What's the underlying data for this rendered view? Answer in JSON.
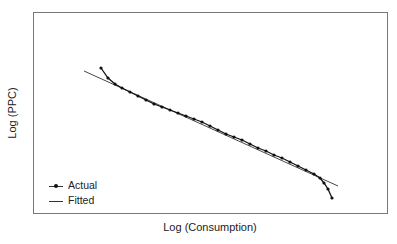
{
  "chart_data": {
    "type": "line",
    "title": "",
    "xlabel": "Log (Consumption)",
    "ylabel": "Log (PPC)",
    "grid": false,
    "ticks": false,
    "legend_position": "lower-left",
    "legend": [
      "Actual",
      "Fitted"
    ],
    "series": [
      {
        "name": "Actual",
        "style": "line-with-dot-markers",
        "points_px": [
          [
            101,
            68
          ],
          [
            108,
            78
          ],
          [
            115,
            84
          ],
          [
            122,
            88
          ],
          [
            130,
            92
          ],
          [
            138,
            96
          ],
          [
            146,
            100
          ],
          [
            154,
            104
          ],
          [
            162,
            107
          ],
          [
            170,
            110
          ],
          [
            178,
            113
          ],
          [
            186,
            116
          ],
          [
            194,
            119
          ],
          [
            202,
            122
          ],
          [
            210,
            126
          ],
          [
            218,
            130
          ],
          [
            226,
            134
          ],
          [
            234,
            137
          ],
          [
            242,
            140
          ],
          [
            250,
            144
          ],
          [
            258,
            148
          ],
          [
            266,
            151
          ],
          [
            274,
            155
          ],
          [
            282,
            158
          ],
          [
            290,
            162
          ],
          [
            298,
            166
          ],
          [
            306,
            170
          ],
          [
            314,
            174
          ],
          [
            320,
            178
          ],
          [
            324,
            183
          ],
          [
            328,
            189
          ],
          [
            332,
            198
          ]
        ]
      },
      {
        "name": "Fitted",
        "style": "line",
        "points_px": [
          [
            84,
            71
          ],
          [
            338,
            186
          ]
        ]
      }
    ]
  },
  "axes": {
    "x_label": "Log (Consumption)",
    "y_label": "Log (PPC)"
  },
  "legend": {
    "items": [
      {
        "label": "Actual",
        "marker": "line-dot"
      },
      {
        "label": "Fitted",
        "marker": "line"
      }
    ]
  },
  "colors": {
    "frame": "#777777",
    "actual": "#111111",
    "fitted": "#333333"
  }
}
